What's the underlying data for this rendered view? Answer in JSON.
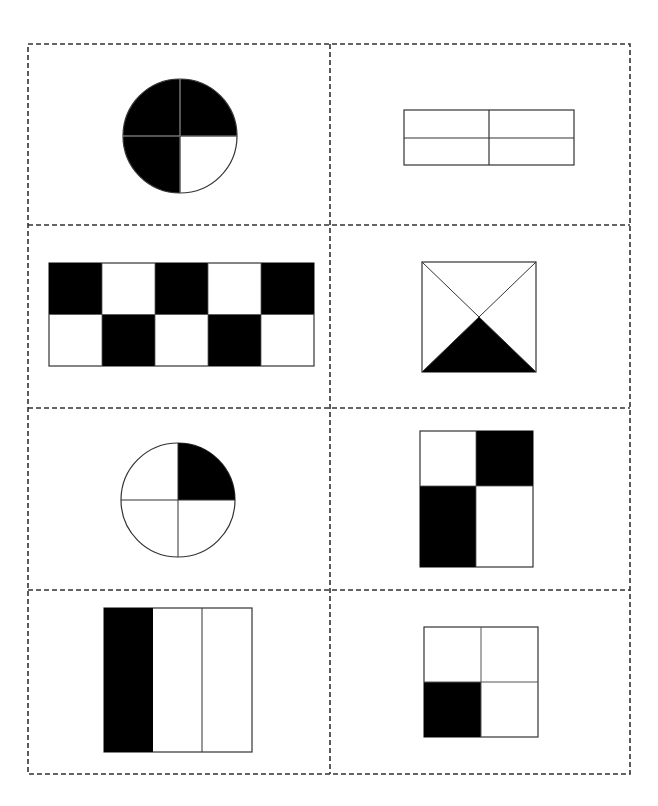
{
  "worksheet": {
    "grid": {
      "rows": 4,
      "cols": 2,
      "border_style": "dashed",
      "border_color": "#333333"
    },
    "colors": {
      "shaded": "#000000",
      "unshaded": "#ffffff",
      "outline": "#333333"
    },
    "cells": [
      {
        "id": "cell-1",
        "shape": "circle",
        "parts": 4,
        "shaded_parts": 3,
        "shaded": [
          "top-left",
          "top-right",
          "bottom-left"
        ]
      },
      {
        "id": "cell-2",
        "shape": "rectangle",
        "parts": 4,
        "layout": "2x2",
        "shaded_parts": 0,
        "shaded": []
      },
      {
        "id": "cell-3",
        "shape": "rectangle",
        "parts": 10,
        "layout": "5x2 checkerboard",
        "shaded_parts": 5,
        "shaded": [
          "r1c1",
          "r1c3",
          "r1c5",
          "r2c2",
          "r2c4"
        ]
      },
      {
        "id": "cell-4",
        "shape": "square",
        "parts": 4,
        "layout": "diagonals",
        "shaded_parts": 1,
        "shaded": [
          "bottom-triangle"
        ]
      },
      {
        "id": "cell-5",
        "shape": "circle",
        "parts": 4,
        "shaded_parts": 1,
        "shaded": [
          "top-right"
        ]
      },
      {
        "id": "cell-6",
        "shape": "rectangle",
        "parts": 4,
        "layout": "2x2",
        "shaded_parts": 2,
        "shaded": [
          "top-right",
          "bottom-left"
        ]
      },
      {
        "id": "cell-7",
        "shape": "rectangle",
        "parts": 3,
        "layout": "3 vertical strips",
        "shaded_parts": 1,
        "shaded": [
          "left"
        ]
      },
      {
        "id": "cell-8",
        "shape": "square",
        "parts": 4,
        "layout": "2x2",
        "shaded_parts": 1,
        "shaded": [
          "bottom-left"
        ]
      }
    ]
  }
}
